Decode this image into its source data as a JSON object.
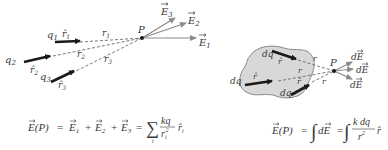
{
  "left_diagram": {
    "charges": [
      {
        "label": "q",
        "sub": "1",
        "unit_vector": "r̂",
        "unit_sub": "1",
        "distance": "r",
        "distance_sub": "1"
      },
      {
        "label": "q",
        "sub": "2",
        "unit_vector": "r̂",
        "unit_sub": "2",
        "distance": "r",
        "distance_sub": "2"
      },
      {
        "label": "q",
        "sub": "3",
        "unit_vector": "r̂",
        "unit_sub": "3",
        "distance": "r",
        "distance_sub": "3"
      }
    ],
    "point": "P",
    "fields": [
      {
        "label": "E",
        "sub": "1"
      },
      {
        "label": "E",
        "sub": "2"
      },
      {
        "label": "E",
        "sub": "3"
      }
    ],
    "equation": {
      "lhs": "E(P)",
      "eq1": "=",
      "terms": [
        "E",
        "E",
        "E"
      ],
      "term_subs": [
        "1",
        "2",
        "3"
      ],
      "plus": "+",
      "eq2": "=",
      "sum_symbol": "∑",
      "sum_index": "i",
      "numerator": "kq",
      "denominator": "r",
      "denominator_sub": "i",
      "denominator_exp": "2",
      "unit": "r̂",
      "unit_sub": "i"
    }
  },
  "right_diagram": {
    "charge_elements": [
      {
        "label": "dq",
        "unit_vector": "r̂",
        "distance": "r"
      },
      {
        "label": "dq",
        "unit_vector": "r̂",
        "distance": "r"
      },
      {
        "label": "dq",
        "unit_vector": "r̂",
        "distance": "r"
      }
    ],
    "point": "P",
    "fields": [
      "dE",
      "dE",
      "dE"
    ],
    "equation": {
      "lhs": "E(P)",
      "eq1": "=",
      "integral": "∫",
      "integrand1": "dE",
      "eq2": "=",
      "numerator": "k dq",
      "denominator": "r",
      "denominator_exp": "2",
      "unit": "r̂"
    }
  },
  "colors": {
    "text": "#3a3a3a",
    "unit_arrow": "#1a1a1a",
    "field_arrow": "#8a8a8a",
    "blob_fill": "#d8d8d8",
    "blob_stroke": "#8a8a8a"
  }
}
